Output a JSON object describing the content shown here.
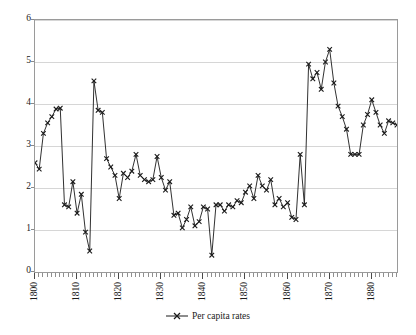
{
  "chart_data": {
    "type": "line",
    "title": "",
    "subtitle": "",
    "xlabel": "",
    "ylabel": "",
    "xlim": [
      1800,
      1886
    ],
    "ylim": [
      0,
      6
    ],
    "grid": true,
    "legend_position": "bottom-center",
    "y_ticks": [
      0,
      1,
      2,
      3,
      4,
      5,
      6
    ],
    "y_tick_labels": [
      "0",
      "1",
      "2",
      "3",
      "4",
      "5",
      "6"
    ],
    "x_ticks": [
      1800,
      1810,
      1820,
      1830,
      1840,
      1850,
      1860,
      1870,
      1880
    ],
    "x_tick_labels": [
      "1800",
      "1810",
      "1820",
      "1830",
      "1840",
      "1850",
      "1860",
      "1870",
      "1880"
    ],
    "x_tick_rotation": 90,
    "marker": "x",
    "line_color": "#1a1a1a",
    "grid_color": "#d6d6d6",
    "frame_color": "#9a9a9a",
    "series": [
      {
        "name": "Per capita rates",
        "x": [
          1800,
          1801,
          1802,
          1803,
          1804,
          1805,
          1806,
          1807,
          1808,
          1809,
          1810,
          1811,
          1812,
          1813,
          1814,
          1815,
          1816,
          1817,
          1818,
          1819,
          1820,
          1821,
          1822,
          1823,
          1824,
          1825,
          1826,
          1827,
          1828,
          1829,
          1830,
          1831,
          1832,
          1833,
          1834,
          1835,
          1836,
          1837,
          1838,
          1839,
          1840,
          1841,
          1842,
          1843,
          1844,
          1845,
          1846,
          1847,
          1848,
          1849,
          1850,
          1851,
          1852,
          1853,
          1854,
          1855,
          1856,
          1857,
          1858,
          1859,
          1860,
          1861,
          1862,
          1863,
          1864,
          1865,
          1866,
          1867,
          1868,
          1869,
          1870,
          1871,
          1872,
          1873,
          1874,
          1875,
          1876,
          1877,
          1878,
          1879,
          1880,
          1881,
          1882,
          1883,
          1884,
          1885,
          1886
        ],
        "values": [
          2.6,
          2.45,
          3.3,
          3.55,
          3.7,
          3.88,
          3.9,
          1.6,
          1.55,
          2.15,
          1.4,
          1.85,
          0.95,
          0.5,
          4.55,
          3.85,
          3.8,
          2.7,
          2.5,
          2.3,
          1.75,
          2.35,
          2.25,
          2.4,
          2.8,
          2.3,
          2.2,
          2.15,
          2.2,
          2.75,
          2.25,
          1.95,
          2.15,
          1.35,
          1.4,
          1.05,
          1.25,
          1.55,
          1.1,
          1.2,
          1.55,
          1.5,
          0.4,
          1.6,
          1.6,
          1.45,
          1.6,
          1.55,
          1.7,
          1.65,
          1.9,
          2.05,
          1.75,
          2.3,
          2.05,
          1.95,
          2.2,
          1.6,
          1.75,
          1.55,
          1.65,
          1.3,
          1.25,
          2.8,
          1.6,
          4.95,
          4.6,
          4.75,
          4.35,
          5.0,
          5.3,
          4.5,
          3.95,
          3.7,
          3.4,
          2.8,
          2.8,
          2.8,
          3.5,
          3.75,
          4.1,
          3.8,
          3.5,
          3.3,
          3.6,
          3.55,
          3.5
        ]
      }
    ]
  },
  "legend": {
    "items": [
      {
        "label": "Per capita rates",
        "marker": "x",
        "color": "#1a1a1a"
      }
    ]
  }
}
